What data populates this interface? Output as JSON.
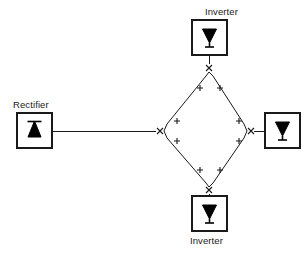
{
  "diagram": {
    "background_color": "#ffffff",
    "line_color": "#1a1a1a",
    "symbol_color": "#000000",
    "nodes": [
      {
        "id": "rectifier",
        "label": "Rectifier",
        "symbol": "rectifier-triangle-up-with-bar",
        "x": 17,
        "y": 113,
        "w": 35,
        "h": 35,
        "label_x": 13,
        "label_y": 100,
        "has_label": true
      },
      {
        "id": "inverter-top",
        "label": "Inverter",
        "symbol": "inverter-triangle-down-with-stem",
        "x": 192,
        "y": 20,
        "w": 35,
        "h": 35,
        "label_x": 205,
        "label_y": 7,
        "has_label": true
      },
      {
        "id": "inverter-right",
        "label": "",
        "symbol": "inverter-triangle-down-with-stem",
        "x": 265,
        "y": 113,
        "w": 35,
        "h": 35,
        "has_label": false
      },
      {
        "id": "inverter-bottom",
        "label": "Inverter",
        "symbol": "inverter-triangle-down-with-stem",
        "x": 192,
        "y": 196,
        "w": 35,
        "h": 35,
        "label_x": 190,
        "label_y": 236,
        "has_label": true
      }
    ],
    "junctions": [
      {
        "id": "junction-west",
        "marker": "x",
        "x": 160,
        "y": 131
      },
      {
        "id": "junction-north",
        "marker": "x",
        "x": 209,
        "y": 68
      },
      {
        "id": "junction-east",
        "marker": "x",
        "x": 250,
        "y": 131
      },
      {
        "id": "junction-south",
        "marker": "x",
        "x": 209,
        "y": 190
      }
    ],
    "breaker_marks": [
      {
        "id": "breaker-nw-upper",
        "marker": "+",
        "x": 200,
        "y": 88
      },
      {
        "id": "breaker-ne-upper",
        "marker": "+",
        "x": 220,
        "y": 88
      },
      {
        "id": "breaker-nw-lower",
        "marker": "+",
        "x": 177,
        "y": 121
      },
      {
        "id": "breaker-ne-lower",
        "marker": "+",
        "x": 239,
        "y": 121
      },
      {
        "id": "breaker-sw-upper",
        "marker": "+",
        "x": 177,
        "y": 141
      },
      {
        "id": "breaker-se-upper",
        "marker": "+",
        "x": 239,
        "y": 141
      },
      {
        "id": "breaker-sw-lower",
        "marker": "+",
        "x": 200,
        "y": 170
      },
      {
        "id": "breaker-se-lower",
        "marker": "+",
        "x": 220,
        "y": 170
      }
    ],
    "connections": [
      {
        "id": "link-rectifier-to-west",
        "from": "rectifier",
        "to": "junction-west",
        "type": "horizontal"
      },
      {
        "id": "link-inverter-top-to-north",
        "from": "inverter-top",
        "to": "junction-north",
        "type": "vertical"
      },
      {
        "id": "link-east-to-inverter-right",
        "from": "junction-east",
        "to": "inverter-right",
        "type": "horizontal"
      },
      {
        "id": "link-south-to-inverter-bottom",
        "from": "junction-south",
        "to": "inverter-bottom",
        "type": "vertical"
      },
      {
        "id": "link-ring-nw",
        "from": "junction-west",
        "to": "junction-north",
        "type": "diagonal"
      },
      {
        "id": "link-ring-ne",
        "from": "junction-north",
        "to": "junction-east",
        "type": "diagonal"
      },
      {
        "id": "link-ring-se",
        "from": "junction-east",
        "to": "junction-south",
        "type": "diagonal"
      },
      {
        "id": "link-ring-sw",
        "from": "junction-south",
        "to": "junction-west",
        "type": "diagonal"
      }
    ]
  }
}
